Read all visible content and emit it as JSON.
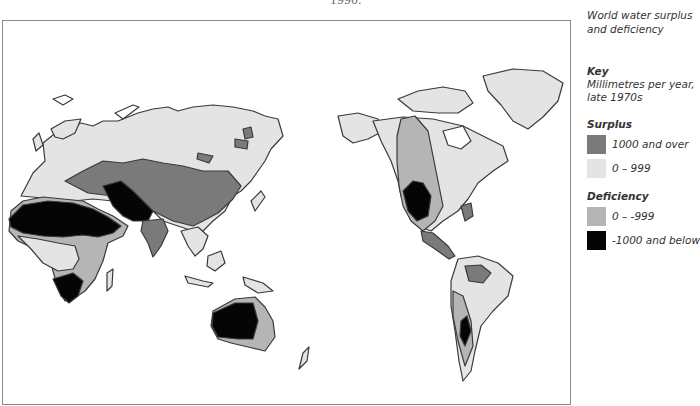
{
  "header": {
    "fragment": "1990."
  },
  "legend": {
    "title": "World water surplus and deficiency",
    "key_heading": "Key",
    "key_subtitle": "Millimetres per year, late 1970s",
    "groups": [
      {
        "label": "Surplus",
        "items": [
          {
            "label": "1000 and over",
            "color": "#7a7a7a"
          },
          {
            "label": "0 – 999",
            "color": "#e4e4e4"
          }
        ]
      },
      {
        "label": "Deficiency",
        "items": [
          {
            "label": "0 – -999",
            "color": "#b5b5b5"
          },
          {
            "label": "-1000 and below",
            "color": "#050505"
          }
        ]
      }
    ]
  },
  "map": {
    "outline_color": "#3a3a3a",
    "frame_color": "#8a8a8a",
    "regions": [
      "Europe",
      "Asia",
      "Africa",
      "Middle East",
      "India",
      "Southeast Asia",
      "Australia",
      "New Zealand",
      "North America",
      "Greenland",
      "Central America",
      "South America"
    ]
  }
}
